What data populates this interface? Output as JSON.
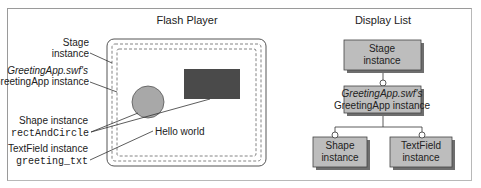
{
  "flash_player": {
    "title": "Flash Player",
    "hello_text": "Hello world"
  },
  "labels": {
    "stage": {
      "line1": "Stage",
      "line2": "instance"
    },
    "greeting_app": {
      "line1": "GreetingApp.swf's",
      "line2": "GreetingApp instance"
    },
    "shape": {
      "line1": "Shape instance",
      "line2": "rectAndCircle"
    },
    "textfield": {
      "line1": "TextField instance",
      "line2": "greeting_txt"
    }
  },
  "display_list": {
    "title": "Display List",
    "nodes": {
      "stage": {
        "line1": "Stage",
        "line2": "instance"
      },
      "greeting_app": {
        "line1": "GreetingApp.swf's",
        "line2": "GreetingApp instance"
      },
      "shape": {
        "line1": "Shape",
        "line2": "instance"
      },
      "textfield": {
        "line1": "TextField",
        "line2": "instance"
      }
    }
  },
  "colors": {
    "box_fill": "#bdbdbd",
    "box_shadow": "#6e6e6e",
    "dark_rect": "#4a4a4a",
    "circle_fill": "#a8a8a8"
  }
}
